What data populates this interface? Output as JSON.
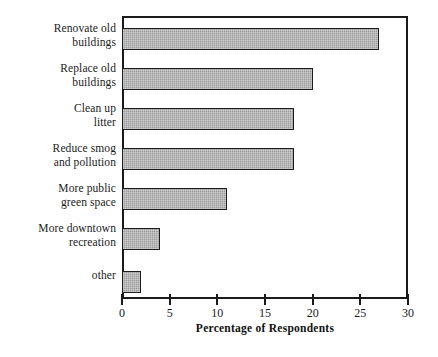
{
  "chart_data": {
    "type": "bar",
    "orientation": "horizontal",
    "title": "",
    "xlabel": "Percentage of Respondents",
    "ylabel": "",
    "xlim": [
      0,
      30
    ],
    "xticks": [
      "0",
      "5",
      "10",
      "15",
      "20",
      "25",
      "30"
    ],
    "grid": false,
    "legend": null,
    "categories": [
      "Renovate old\nbuildings",
      "Replace old\nbuildings",
      "Clean up\nlitter",
      "Reduce smog\nand pollution",
      "More public\ngreen space",
      "More downtown\nrecreation",
      "other"
    ],
    "values": [
      27,
      20,
      18,
      18,
      11,
      4,
      2
    ],
    "bar_fill_color": "#9a9a9a",
    "bar_border_color": "#1c1c1c",
    "axis_color": "#1a1a1a",
    "background_color": "#ffffff"
  }
}
